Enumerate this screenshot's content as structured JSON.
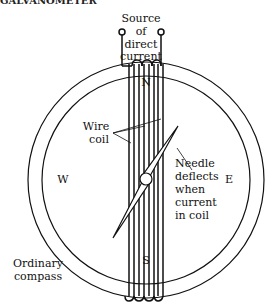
{
  "header": {
    "title": "GALVANOMETER"
  },
  "labels": {
    "source": [
      "Source",
      "of",
      "direct",
      "current"
    ],
    "north": "N",
    "south": "S",
    "west": "W",
    "east": "E",
    "wire_coil": [
      "Wire",
      "coil"
    ],
    "needle": [
      "Needle",
      "deflects",
      "when",
      "current",
      "in coil"
    ],
    "compass": [
      "Ordinary",
      "compass"
    ]
  },
  "colors": {
    "line": "#111111",
    "background": "#ffffff"
  }
}
